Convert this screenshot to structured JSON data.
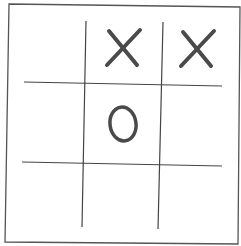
{
  "game": {
    "type": "tic-tac-toe",
    "grid_size": 3,
    "board": [
      [
        "",
        "X",
        "X"
      ],
      [
        "",
        "O",
        ""
      ],
      [
        "",
        "",
        ""
      ]
    ]
  },
  "colors": {
    "background": "#ffffff",
    "frame": "#555555",
    "grid": "#444444",
    "mark": "#4a4a4a"
  }
}
